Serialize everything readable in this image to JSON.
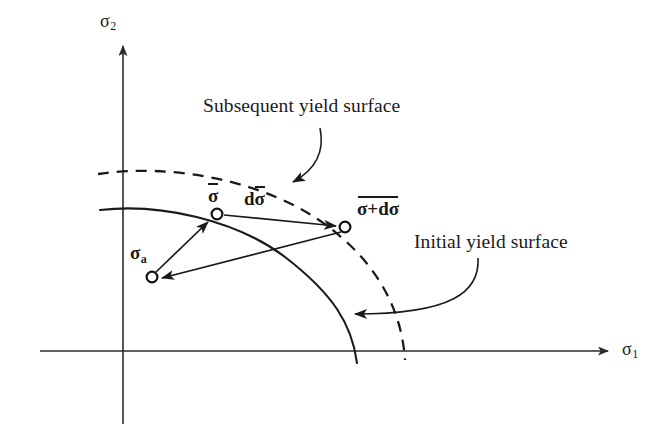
{
  "figure": {
    "title_semantic": "kinematic-hardening-yield-surface-diagram",
    "background_color": "#ffffff",
    "ink_color": "#1a1a1a"
  },
  "axes": {
    "x_label": "σ",
    "x_label_sub": "1",
    "y_label": "σ",
    "y_label_sub": "2",
    "origin_px": [
      123,
      351
    ],
    "x_axis_end_px": [
      614,
      351
    ],
    "y_axis_end_px": [
      123,
      40
    ]
  },
  "captions": {
    "subsequent": "Subsequent yield surface",
    "initial": "Initial yield surface"
  },
  "points": [
    {
      "name": "back-stress-point",
      "label": "σ",
      "label_sub": "a",
      "overbar": false,
      "px": [
        152,
        277
      ]
    },
    {
      "name": "current-stress-point",
      "label": "σ",
      "label_sub": "",
      "overbar": true,
      "px": [
        217,
        214
      ]
    },
    {
      "name": "updated-stress-point",
      "label": "σ+dσ",
      "label_sub": "",
      "overbar": true,
      "px": [
        345,
        227
      ]
    }
  ],
  "vectors": [
    {
      "name": "stress-increment-vector",
      "label": "dσ",
      "overbar": true,
      "from": "current-stress-point",
      "to": "updated-stress-point"
    },
    {
      "name": "back-stress-to-current-vector",
      "label": "",
      "from": "back-stress-point",
      "to": "current-stress-point"
    },
    {
      "name": "updated-to-back-stress-vector",
      "label": "",
      "from": "updated-stress-point",
      "to": "back-stress-point"
    }
  ],
  "curves": [
    {
      "name": "initial-yield-surface-curve",
      "style": "solid",
      "caption_ref": "initial"
    },
    {
      "name": "subsequent-yield-surface-curve",
      "style": "dashed",
      "caption_ref": "subsequent"
    }
  ]
}
